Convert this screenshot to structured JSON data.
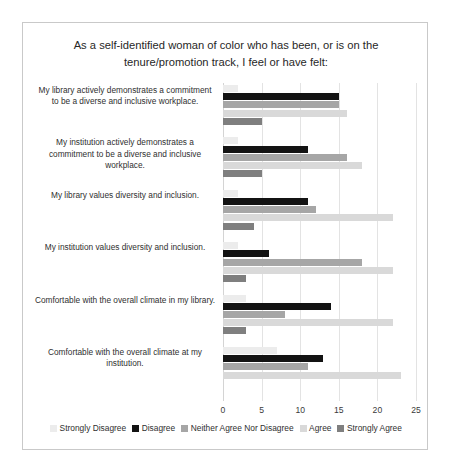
{
  "chart": {
    "title": "As a self-identified woman of color who has been, or is on the tenure/promotion  track, I feel or have felt:"
  },
  "chart_data": {
    "type": "bar",
    "orientation": "horizontal",
    "title": "As a self-identified woman of color who has been, or is on the tenure/promotion  track, I feel or have felt:",
    "xlabel": "",
    "ylabel": "",
    "xlim": [
      0,
      25
    ],
    "xticks": [
      0,
      5,
      10,
      15,
      20,
      25
    ],
    "grid": true,
    "legend_position": "bottom",
    "categories": [
      "My library actively demonstrates a commitment to be a diverse and inclusive workplace.",
      "My institution actively demonstrates a commitment to be a diverse and inclusive workplace.",
      "My library values diversity and inclusion.",
      "My institution values diversity and inclusion.",
      "Comfortable with the overall climate in my library.",
      "Comfortable with the overall climate at my institution."
    ],
    "series": [
      {
        "name": "Strongly Disagree",
        "color": "#ececec",
        "values": [
          2,
          2,
          2,
          2,
          3,
          7
        ]
      },
      {
        "name": "Disagree",
        "color": "#131313",
        "values": [
          15,
          11,
          11,
          6,
          14,
          13
        ]
      },
      {
        "name": "Neither Agree Nor Disagree",
        "color": "#a6a6a6",
        "values": [
          15,
          16,
          12,
          18,
          8,
          11
        ]
      },
      {
        "name": "Agree",
        "color": "#d9d9d9",
        "values": [
          16,
          18,
          22,
          22,
          22,
          23
        ]
      },
      {
        "name": "Strongly Agree",
        "color": "#7f7f7f",
        "values": [
          5,
          5,
          4,
          3,
          3,
          0
        ]
      }
    ]
  }
}
